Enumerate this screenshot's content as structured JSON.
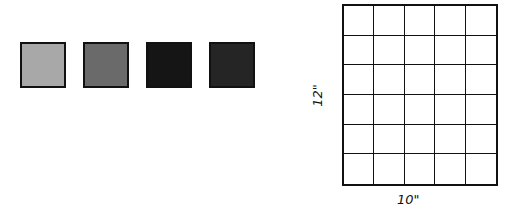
{
  "swatches": [
    {
      "name": "light-gray",
      "color": "#a8a8a8"
    },
    {
      "name": "medium-gray",
      "color": "#6a6a6a"
    },
    {
      "name": "near-black",
      "color": "#151515"
    },
    {
      "name": "dark-textured",
      "color": "#252525"
    }
  ],
  "grid": {
    "columns": 5,
    "rows": 6,
    "width_label": "10\"",
    "height_label": "12\""
  }
}
